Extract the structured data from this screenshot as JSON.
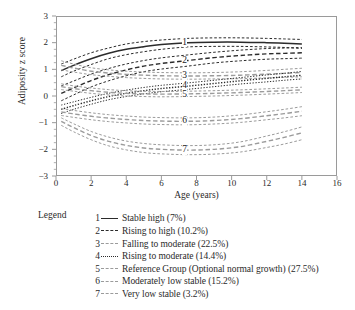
{
  "chart_data": {
    "type": "line",
    "title": "",
    "xlabel": "Age (years)",
    "ylabel": "Adiposity z score",
    "xlim": [
      0,
      16
    ],
    "ylim": [
      -3,
      3
    ],
    "xticks": [
      0,
      2,
      4,
      6,
      8,
      10,
      12,
      14,
      16
    ],
    "yticks": [
      3,
      2,
      1,
      0,
      -1,
      -2,
      -3
    ],
    "grid": false,
    "legend_position": "below",
    "legend_title": "Legend",
    "x_data_range": [
      0.3,
      14
    ],
    "series": [
      {
        "id": "1",
        "name": "Stable high",
        "percent": "7%",
        "label": "Stable high (7%)",
        "linestyle": "solid",
        "color": "#2b2b2b",
        "x": [
          0.3,
          1,
          2,
          3,
          4,
          5,
          6,
          7.5,
          9,
          10.5,
          12,
          13,
          14
        ],
        "y": [
          0.95,
          1.15,
          1.4,
          1.6,
          1.75,
          1.85,
          1.93,
          2.0,
          2.02,
          2.02,
          2.0,
          1.98,
          1.95
        ],
        "band_upper": [
          1.2,
          1.38,
          1.62,
          1.8,
          1.95,
          2.04,
          2.1,
          2.16,
          2.18,
          2.18,
          2.16,
          2.14,
          2.12
        ],
        "band_lower": [
          0.72,
          0.93,
          1.18,
          1.4,
          1.55,
          1.66,
          1.75,
          1.84,
          1.86,
          1.86,
          1.84,
          1.82,
          1.78
        ]
      },
      {
        "id": "2",
        "name": "Rising to high",
        "percent": "10.2%",
        "label": "Rising to high (10.2%)",
        "linestyle": "dashed",
        "color": "#2b2b2b",
        "x": [
          0.3,
          1,
          2,
          3,
          4,
          5,
          6,
          7.5,
          9,
          10.5,
          12,
          13,
          14
        ],
        "y": [
          0.1,
          0.3,
          0.58,
          0.8,
          0.98,
          1.12,
          1.22,
          1.33,
          1.44,
          1.52,
          1.58,
          1.6,
          1.62
        ],
        "band_upper": [
          0.38,
          0.56,
          0.82,
          1.03,
          1.2,
          1.33,
          1.43,
          1.54,
          1.64,
          1.72,
          1.78,
          1.8,
          1.82
        ],
        "band_lower": [
          -0.18,
          0.04,
          0.34,
          0.57,
          0.76,
          0.91,
          1.01,
          1.12,
          1.24,
          1.32,
          1.38,
          1.4,
          1.42
        ]
      },
      {
        "id": "3",
        "name": "Falling to moderate",
        "percent": "22.5%",
        "label": "Falling to moderate (22.5%)",
        "linestyle": "dashed",
        "color": "#9b9b9b",
        "x": [
          0.3,
          1,
          2,
          3,
          4,
          5,
          6,
          7.5,
          9,
          10.5,
          12,
          13,
          14
        ],
        "y": [
          1.15,
          1.05,
          0.93,
          0.86,
          0.81,
          0.78,
          0.76,
          0.75,
          0.76,
          0.78,
          0.82,
          0.85,
          0.88
        ],
        "band_upper": [
          1.32,
          1.2,
          1.06,
          0.98,
          0.93,
          0.9,
          0.88,
          0.87,
          0.88,
          0.91,
          0.96,
          1.0,
          1.04
        ],
        "band_lower": [
          0.98,
          0.9,
          0.8,
          0.74,
          0.69,
          0.66,
          0.64,
          0.63,
          0.64,
          0.65,
          0.68,
          0.7,
          0.72
        ]
      },
      {
        "id": "4",
        "name": "Rising to moderate",
        "percent": "14.4%",
        "label": "Rising to moderate (14.4%)",
        "linestyle": "dotted",
        "color": "#2b2b2b",
        "x": [
          0.3,
          1,
          2,
          3,
          4,
          5,
          6,
          7.5,
          9,
          10.5,
          12,
          13,
          14
        ],
        "y": [
          -0.5,
          -0.36,
          -0.18,
          -0.02,
          0.1,
          0.2,
          0.28,
          0.37,
          0.47,
          0.57,
          0.66,
          0.72,
          0.78
        ],
        "band_upper": [
          -0.34,
          -0.22,
          -0.05,
          0.1,
          0.22,
          0.32,
          0.4,
          0.49,
          0.59,
          0.69,
          0.79,
          0.85,
          0.92
        ],
        "band_lower": [
          -0.66,
          -0.5,
          -0.31,
          -0.14,
          -0.02,
          0.08,
          0.16,
          0.25,
          0.35,
          0.45,
          0.53,
          0.59,
          0.64
        ]
      },
      {
        "id": "5",
        "name": "Reference Group (Optional normal growth)",
        "percent": "27.5%",
        "label": "Reference Group (Optional normal growth) (27.5%)",
        "linestyle": "dashed",
        "color": "#9b9b9b",
        "x": [
          0.3,
          1,
          2,
          3,
          4,
          5,
          6,
          7.5,
          9,
          10.5,
          12,
          13,
          14
        ],
        "y": [
          0.35,
          0.28,
          0.2,
          0.14,
          0.1,
          0.08,
          0.07,
          0.08,
          0.1,
          0.13,
          0.17,
          0.2,
          0.23
        ],
        "band_upper": [
          0.46,
          0.38,
          0.3,
          0.24,
          0.2,
          0.18,
          0.17,
          0.18,
          0.2,
          0.23,
          0.27,
          0.3,
          0.33
        ],
        "band_lower": [
          0.24,
          0.18,
          0.1,
          0.04,
          0.0,
          -0.02,
          -0.03,
          -0.02,
          0.0,
          0.03,
          0.07,
          0.1,
          0.13
        ]
      },
      {
        "id": "6",
        "name": "Moderately low stable",
        "percent": "15.2%",
        "label": "Moderately low stable (15.2%)",
        "linestyle": "dashed",
        "color": "#9b9b9b",
        "x": [
          0.3,
          1,
          2,
          3,
          4,
          5,
          6,
          7.5,
          9,
          10.5,
          12,
          13,
          14
        ],
        "y": [
          -0.6,
          -0.67,
          -0.76,
          -0.83,
          -0.88,
          -0.92,
          -0.94,
          -0.95,
          -0.92,
          -0.85,
          -0.74,
          -0.66,
          -0.57
        ],
        "band_upper": [
          -0.47,
          -0.54,
          -0.63,
          -0.7,
          -0.75,
          -0.79,
          -0.81,
          -0.82,
          -0.79,
          -0.71,
          -0.59,
          -0.5,
          -0.4
        ],
        "band_lower": [
          -0.73,
          -0.8,
          -0.89,
          -0.96,
          -1.01,
          -1.05,
          -1.07,
          -1.08,
          -1.05,
          -0.99,
          -0.89,
          -0.82,
          -0.74
        ]
      },
      {
        "id": "7",
        "name": "Very low stable",
        "percent": "3.2%",
        "label": "Very low stable (3.2%)",
        "linestyle": "dashed",
        "color": "#9b9b9b",
        "x": [
          0.3,
          1,
          2,
          3,
          4,
          5,
          6,
          7.5,
          9,
          10.5,
          12,
          13,
          14
        ],
        "y": [
          -0.95,
          -1.18,
          -1.48,
          -1.7,
          -1.85,
          -1.95,
          -2.0,
          -2.03,
          -2.0,
          -1.9,
          -1.7,
          -1.55,
          -1.38
        ],
        "band_upper": [
          -0.82,
          -1.04,
          -1.33,
          -1.54,
          -1.69,
          -1.78,
          -1.83,
          -1.86,
          -1.83,
          -1.72,
          -1.5,
          -1.34,
          -1.16
        ],
        "band_lower": [
          -1.1,
          -1.34,
          -1.64,
          -1.87,
          -2.02,
          -2.12,
          -2.17,
          -2.2,
          -2.18,
          -2.1,
          -1.93,
          -1.8,
          -1.64
        ]
      }
    ]
  },
  "axes": {
    "ylabel": "Adiposity z score",
    "xlabel": "Age (years)",
    "ytick_labels": [
      "3",
      "2",
      "1",
      "0",
      "−1",
      "−2",
      "−3"
    ],
    "xtick_labels": [
      "0",
      "2",
      "4",
      "6",
      "8",
      "10",
      "12",
      "14",
      "16"
    ]
  },
  "curve_labels": [
    {
      "text": "1",
      "x": 7.5,
      "y": 2.0
    },
    {
      "text": "2",
      "x": 7.5,
      "y": 1.33
    },
    {
      "text": "3",
      "x": 7.5,
      "y": 0.75
    },
    {
      "text": "4",
      "x": 7.5,
      "y": 0.37
    },
    {
      "text": "5",
      "x": 7.5,
      "y": 0.05
    },
    {
      "text": "6",
      "x": 7.5,
      "y": -0.95
    },
    {
      "text": "7",
      "x": 7.5,
      "y": -2.03
    }
  ],
  "legend": {
    "title": "Legend",
    "entries": [
      {
        "num": "1",
        "style": "solid",
        "color": "#2b2b2b",
        "label": "Stable high (7%)"
      },
      {
        "num": "2",
        "style": "dashed",
        "color": "#2b2b2b",
        "label": "Rising to high (10.2%)"
      },
      {
        "num": "3",
        "style": "dashed",
        "color": "#9b9b9b",
        "label": "Falling to moderate (22.5%)"
      },
      {
        "num": "4",
        "style": "dotted",
        "color": "#2b2b2b",
        "label": "Rising to moderate (14.4%)"
      },
      {
        "num": "5",
        "style": "dashed",
        "color": "#9b9b9b",
        "label": "Reference Group (Optional normal growth) (27.5%)"
      },
      {
        "num": "6",
        "style": "dashed",
        "color": "#9b9b9b",
        "label": "Moderately low stable (15.2%)"
      },
      {
        "num": "7",
        "style": "dashed",
        "color": "#9b9b9b",
        "label": "Very low stable (3.2%)"
      }
    ]
  },
  "colors": {
    "dark": "#2b2b2b",
    "light": "#9b9b9b",
    "frame": "#9a9a9a",
    "background": "#ffffff"
  }
}
